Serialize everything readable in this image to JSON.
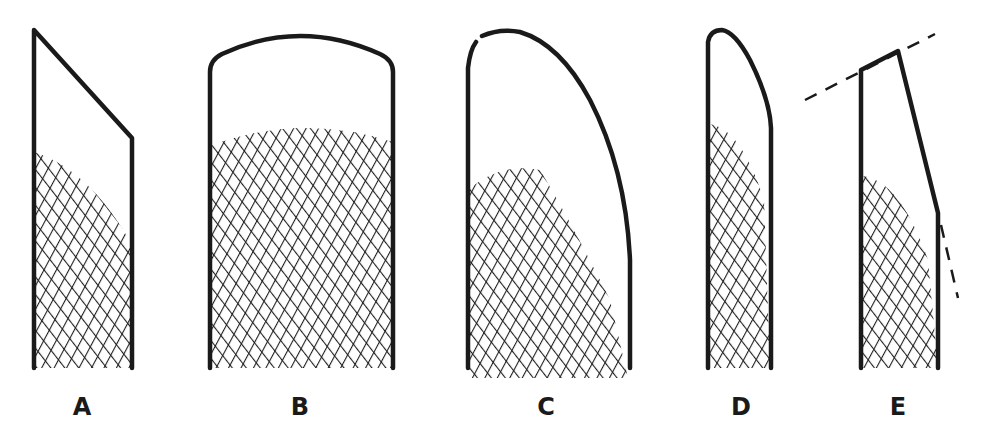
{
  "diagram": {
    "type": "figure-panel",
    "colors": {
      "ink": "#1a1a1a",
      "background": "#ffffff"
    },
    "figures": [
      {
        "label": "A",
        "top_shape": "slanted straight edge descending to the right",
        "hatch_fill": "lower portion with curved upper boundary"
      },
      {
        "label": "B",
        "top_shape": "shallow rounded arch",
        "hatch_fill": "lower two-thirds with domed upper boundary"
      },
      {
        "label": "C",
        "top_shape": "tall curved arc sweeping down to the right",
        "hatch_fill": "lower half with curved upper boundary"
      },
      {
        "label": "D",
        "top_shape": "narrow rounded curve sweeping down to the right",
        "hatch_fill": "lower two-thirds, narrow"
      },
      {
        "label": "E",
        "top_shape": "slanted straight top with dashed extension lines and tapered right side",
        "hatch_fill": "lower half with curved upper boundary"
      }
    ]
  }
}
